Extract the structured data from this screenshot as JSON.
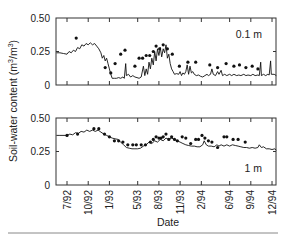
{
  "chart_data": {
    "type": "line",
    "xlabel": "Date",
    "ylabel": "Soil-water content (m³/m³)",
    "ylabel_parts": {
      "main": "Soil-water content (m",
      "sup1": "3",
      "mid": "/m",
      "sup2": "3",
      "end": ")"
    },
    "x_tick_labels": [
      "7/92",
      "10/92",
      "1/93",
      "5/93",
      "8/93",
      "11/93",
      "2/94",
      "6/94",
      "9/94",
      "12/94"
    ],
    "x_tick_months": [
      0,
      3,
      6,
      10,
      13,
      16,
      19,
      23,
      26,
      29
    ],
    "y_tick_labels": [
      "0.50",
      "0.25",
      "0"
    ],
    "ylim": [
      0,
      0.5
    ],
    "legend": {
      "line": "simulated",
      "points": "measured"
    },
    "panels": [
      {
        "label": "0.1 m",
        "line": [
          [
            -1.5,
            0.24
          ],
          [
            -1,
            0.24
          ],
          [
            -0.5,
            0.235
          ],
          [
            0,
            0.23
          ],
          [
            0.3,
            0.25
          ],
          [
            0.6,
            0.24
          ],
          [
            0.9,
            0.26
          ],
          [
            1.2,
            0.25
          ],
          [
            1.5,
            0.28
          ],
          [
            1.8,
            0.27
          ],
          [
            2.1,
            0.3
          ],
          [
            2.4,
            0.29
          ],
          [
            2.7,
            0.31
          ],
          [
            3,
            0.3
          ],
          [
            3.3,
            0.315
          ],
          [
            3.6,
            0.3
          ],
          [
            3.9,
            0.31
          ],
          [
            4.2,
            0.29
          ],
          [
            4.5,
            0.27
          ],
          [
            4.8,
            0.24
          ],
          [
            5,
            0.2
          ],
          [
            5.2,
            0.22
          ],
          [
            5.4,
            0.18
          ],
          [
            5.6,
            0.2
          ],
          [
            5.8,
            0.16
          ],
          [
            6,
            0.12
          ],
          [
            6.2,
            0.08
          ],
          [
            6.4,
            0.05
          ],
          [
            6.7,
            0.05
          ],
          [
            7,
            0.05
          ],
          [
            7.3,
            0.055
          ],
          [
            7.6,
            0.05
          ],
          [
            7.9,
            0.06
          ],
          [
            8.1,
            0.05
          ],
          [
            8.3,
            0.16
          ],
          [
            8.4,
            0.07
          ],
          [
            8.7,
            0.08
          ],
          [
            9,
            0.06
          ],
          [
            9.3,
            0.07
          ],
          [
            9.6,
            0.06
          ],
          [
            9.9,
            0.055
          ],
          [
            10.2,
            0.05
          ],
          [
            10.5,
            0.06
          ],
          [
            10.8,
            0.14
          ],
          [
            11,
            0.07
          ],
          [
            11.2,
            0.12
          ],
          [
            11.4,
            0.08
          ],
          [
            11.6,
            0.17
          ],
          [
            11.8,
            0.12
          ],
          [
            12,
            0.2
          ],
          [
            12.2,
            0.15
          ],
          [
            12.4,
            0.25
          ],
          [
            12.6,
            0.18
          ],
          [
            12.8,
            0.27
          ],
          [
            13,
            0.22
          ],
          [
            13.2,
            0.28
          ],
          [
            13.4,
            0.21
          ],
          [
            13.6,
            0.27
          ],
          [
            13.8,
            0.24
          ],
          [
            14,
            0.3
          ],
          [
            14.2,
            0.2
          ],
          [
            14.4,
            0.23
          ],
          [
            14.6,
            0.16
          ],
          [
            14.8,
            0.12
          ],
          [
            15,
            0.1
          ],
          [
            15.2,
            0.08
          ],
          [
            15.5,
            0.085
          ],
          [
            15.8,
            0.08
          ],
          [
            16,
            0.1
          ],
          [
            16.2,
            0.07
          ],
          [
            16.4,
            0.09
          ],
          [
            16.6,
            0.08
          ],
          [
            16.8,
            0.1
          ],
          [
            17,
            0.15
          ],
          [
            17.2,
            0.08
          ],
          [
            17.4,
            0.14
          ],
          [
            17.6,
            0.09
          ],
          [
            17.8,
            0.1
          ],
          [
            18,
            0.08
          ],
          [
            18.3,
            0.07
          ],
          [
            18.6,
            0.075
          ],
          [
            18.9,
            0.065
          ],
          [
            19.2,
            0.06
          ],
          [
            19.5,
            0.07
          ],
          [
            19.8,
            0.08
          ],
          [
            20,
            0.07
          ],
          [
            20.3,
            0.08
          ],
          [
            20.5,
            0.12
          ],
          [
            20.7,
            0.08
          ],
          [
            21,
            0.07
          ],
          [
            21.3,
            0.1
          ],
          [
            21.5,
            0.08
          ],
          [
            21.8,
            0.11
          ],
          [
            22,
            0.07
          ],
          [
            22.3,
            0.08
          ],
          [
            22.6,
            0.07
          ],
          [
            23,
            0.08
          ],
          [
            23.3,
            0.07
          ],
          [
            23.6,
            0.08
          ],
          [
            24,
            0.07
          ],
          [
            24.3,
            0.075
          ],
          [
            24.6,
            0.07
          ],
          [
            25,
            0.08
          ],
          [
            25.3,
            0.07
          ],
          [
            25.6,
            0.075
          ],
          [
            26,
            0.07
          ],
          [
            26.3,
            0.08
          ],
          [
            26.6,
            0.07
          ],
          [
            27,
            0.075
          ],
          [
            27.2,
            0.07
          ],
          [
            27.4,
            0.17
          ],
          [
            27.5,
            0.07
          ],
          [
            27.8,
            0.08
          ],
          [
            28.1,
            0.07
          ],
          [
            28.4,
            0.08
          ],
          [
            28.6,
            0.075
          ],
          [
            28.8,
            0.18
          ],
          [
            28.9,
            0.08
          ],
          [
            29.3,
            0.08
          ],
          [
            29.6,
            0.07
          ]
        ],
        "points": [
          [
            1.3,
            0.35
          ],
          [
            5.4,
            0.13
          ],
          [
            6.2,
            0.09
          ],
          [
            6.8,
            0.16
          ],
          [
            7.6,
            0.23
          ],
          [
            8.2,
            0.26
          ],
          [
            9.6,
            0.14
          ],
          [
            10.2,
            0.2
          ],
          [
            10.7,
            0.2
          ],
          [
            11.2,
            0.22
          ],
          [
            11.7,
            0.22
          ],
          [
            12.2,
            0.25
          ],
          [
            12.6,
            0.29
          ],
          [
            13.1,
            0.27
          ],
          [
            13.6,
            0.3
          ],
          [
            14.2,
            0.27
          ],
          [
            14.9,
            0.23
          ],
          [
            15.9,
            0.14
          ],
          [
            17.1,
            0.17
          ],
          [
            18.2,
            0.17
          ],
          [
            20.2,
            0.15
          ],
          [
            21.3,
            0.13
          ],
          [
            22.5,
            0.16
          ],
          [
            23.6,
            0.14
          ],
          [
            24.4,
            0.15
          ],
          [
            25.3,
            0.13
          ],
          [
            26.2,
            0.14
          ],
          [
            27,
            0.12
          ]
        ]
      },
      {
        "label": "1 m",
        "line": [
          [
            -1.5,
            0.37
          ],
          [
            -1,
            0.37
          ],
          [
            0,
            0.37
          ],
          [
            0.4,
            0.38
          ],
          [
            0.8,
            0.375
          ],
          [
            1.2,
            0.39
          ],
          [
            1.6,
            0.385
          ],
          [
            2,
            0.4
          ],
          [
            2.4,
            0.395
          ],
          [
            2.8,
            0.41
          ],
          [
            3.2,
            0.4
          ],
          [
            3.6,
            0.41
          ],
          [
            4,
            0.4
          ],
          [
            4.4,
            0.41
          ],
          [
            4.8,
            0.395
          ],
          [
            5.2,
            0.38
          ],
          [
            5.6,
            0.37
          ],
          [
            6,
            0.36
          ],
          [
            6.4,
            0.35
          ],
          [
            6.8,
            0.345
          ],
          [
            7.2,
            0.34
          ],
          [
            7.6,
            0.32
          ],
          [
            8,
            0.3
          ],
          [
            8.4,
            0.28
          ],
          [
            8.8,
            0.275
          ],
          [
            9.2,
            0.27
          ],
          [
            9.6,
            0.27
          ],
          [
            10,
            0.27
          ],
          [
            10.4,
            0.275
          ],
          [
            10.8,
            0.29
          ],
          [
            11.2,
            0.3
          ],
          [
            11.6,
            0.32
          ],
          [
            12,
            0.31
          ],
          [
            12.4,
            0.33
          ],
          [
            12.8,
            0.32
          ],
          [
            13.2,
            0.34
          ],
          [
            13.6,
            0.33
          ],
          [
            14,
            0.35
          ],
          [
            14.4,
            0.34
          ],
          [
            14.8,
            0.35
          ],
          [
            15.2,
            0.34
          ],
          [
            15.6,
            0.33
          ],
          [
            16,
            0.32
          ],
          [
            16.4,
            0.31
          ],
          [
            16.8,
            0.3
          ],
          [
            17.2,
            0.295
          ],
          [
            17.6,
            0.29
          ],
          [
            18,
            0.29
          ],
          [
            18.4,
            0.285
          ],
          [
            18.8,
            0.285
          ],
          [
            19.2,
            0.3
          ],
          [
            19.4,
            0.33
          ],
          [
            19.7,
            0.3
          ],
          [
            20,
            0.29
          ],
          [
            20.4,
            0.29
          ],
          [
            20.8,
            0.285
          ],
          [
            21.2,
            0.3
          ],
          [
            21.5,
            0.29
          ],
          [
            21.8,
            0.3
          ],
          [
            22.2,
            0.29
          ],
          [
            22.6,
            0.3
          ],
          [
            23,
            0.29
          ],
          [
            23.4,
            0.3
          ],
          [
            23.8,
            0.295
          ],
          [
            24.2,
            0.29
          ],
          [
            24.6,
            0.285
          ],
          [
            25,
            0.28
          ],
          [
            25.4,
            0.28
          ],
          [
            25.8,
            0.275
          ],
          [
            26.2,
            0.28
          ],
          [
            26.6,
            0.275
          ],
          [
            27,
            0.28
          ],
          [
            27.2,
            0.3
          ],
          [
            27.5,
            0.28
          ],
          [
            27.8,
            0.285
          ],
          [
            28.2,
            0.27
          ],
          [
            28.6,
            0.27
          ],
          [
            29,
            0.265
          ],
          [
            29.4,
            0.27
          ],
          [
            29.6,
            0.26
          ]
        ],
        "points": [
          [
            0,
            0.37
          ],
          [
            1.5,
            0.38
          ],
          [
            3.8,
            0.42
          ],
          [
            4.5,
            0.42
          ],
          [
            5.3,
            0.38
          ],
          [
            6,
            0.36
          ],
          [
            6.7,
            0.33
          ],
          [
            7.3,
            0.33
          ],
          [
            7.9,
            0.32
          ],
          [
            8.6,
            0.3
          ],
          [
            9.3,
            0.3
          ],
          [
            9.8,
            0.3
          ],
          [
            10.5,
            0.3
          ],
          [
            11.1,
            0.3
          ],
          [
            11.8,
            0.32
          ],
          [
            12.2,
            0.34
          ],
          [
            12.6,
            0.36
          ],
          [
            13,
            0.35
          ],
          [
            13.3,
            0.35
          ],
          [
            13.6,
            0.36
          ],
          [
            14,
            0.38
          ],
          [
            14.4,
            0.34
          ],
          [
            14.8,
            0.36
          ],
          [
            15.2,
            0.34
          ],
          [
            15.6,
            0.33
          ],
          [
            16.3,
            0.36
          ],
          [
            16.8,
            0.35
          ],
          [
            17.5,
            0.31
          ],
          [
            18.2,
            0.34
          ],
          [
            18.6,
            0.34
          ],
          [
            19.1,
            0.37
          ],
          [
            19.5,
            0.35
          ],
          [
            20,
            0.33
          ],
          [
            20.5,
            0.32
          ],
          [
            21.3,
            0.28
          ],
          [
            22.2,
            0.36
          ],
          [
            22.6,
            0.36
          ],
          [
            23.5,
            0.34
          ],
          [
            24.2,
            0.34
          ],
          [
            25.2,
            0.32
          ]
        ]
      }
    ]
  },
  "plot_layout": {
    "x0": 67,
    "x_per_month": 7.07,
    "left": 56,
    "right": 276,
    "panels": [
      {
        "top": 18,
        "bottom": 85
      },
      {
        "top": 118,
        "bottom": 185
      }
    ]
  }
}
